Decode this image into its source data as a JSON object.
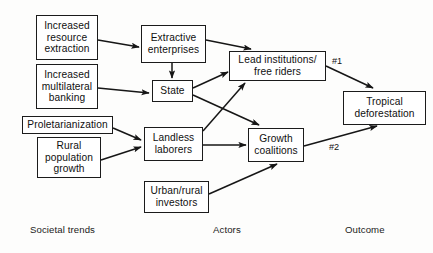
{
  "diagram": {
    "background_color": "#fdfdfc",
    "line_color": "#1b1b1b",
    "nodes": [
      {
        "id": "increased_resource_extraction",
        "label": "Increased\nresource\nextraction",
        "column": "societal-trends"
      },
      {
        "id": "increased_multilateral_banking",
        "label": "Increased\nmultilateral\nbanking",
        "column": "societal-trends"
      },
      {
        "id": "proletarianization",
        "label": "Proletarianization",
        "column": "societal-trends"
      },
      {
        "id": "rural_population_growth",
        "label": "Rural\npopulation\ngrowth",
        "column": "societal-trends"
      },
      {
        "id": "extractive_enterprises",
        "label": "Extractive\nenterprises",
        "column": "actors"
      },
      {
        "id": "state",
        "label": "State",
        "column": "actors"
      },
      {
        "id": "landless_laborers",
        "label": "Landless\nlaborers",
        "column": "actors"
      },
      {
        "id": "urban_rural_investors",
        "label": "Urban/rural\ninvestors",
        "column": "actors"
      },
      {
        "id": "lead_institutions_free_riders",
        "label": "Lead institutions/\nfree riders",
        "column": "actors"
      },
      {
        "id": "growth_coalitions",
        "label": "Growth\ncoalitions",
        "column": "actors"
      },
      {
        "id": "tropical_deforestation",
        "label": "Tropical\ndeforestation",
        "column": "outcome"
      }
    ],
    "edges": [
      {
        "from": "increased_resource_extraction",
        "to": "extractive_enterprises",
        "label": ""
      },
      {
        "from": "increased_multilateral_banking",
        "to": "state",
        "label": ""
      },
      {
        "from": "extractive_enterprises",
        "to": "state",
        "label": ""
      },
      {
        "from": "extractive_enterprises",
        "to": "lead_institutions_free_riders",
        "label": ""
      },
      {
        "from": "state",
        "to": "lead_institutions_free_riders",
        "label": ""
      },
      {
        "from": "state",
        "to": "growth_coalitions",
        "label": ""
      },
      {
        "from": "proletarianization",
        "to": "landless_laborers",
        "label": ""
      },
      {
        "from": "rural_population_growth",
        "to": "landless_laborers",
        "label": ""
      },
      {
        "from": "landless_laborers",
        "to": "lead_institutions_free_riders",
        "label": ""
      },
      {
        "from": "landless_laborers",
        "to": "growth_coalitions",
        "label": ""
      },
      {
        "from": "urban_rural_investors",
        "to": "growth_coalitions",
        "label": ""
      },
      {
        "from": "lead_institutions_free_riders",
        "to": "tropical_deforestation",
        "label": "#1"
      },
      {
        "from": "growth_coalitions",
        "to": "tropical_deforestation",
        "label": "#2"
      }
    ],
    "edge_labels": {
      "lead_to_outcome": "#1",
      "growth_to_outcome": "#2"
    },
    "column_labels": {
      "societal_trends": "Societal trends",
      "actors": "Actors",
      "outcome": "Outcome"
    },
    "node_text": {
      "increased_resource_extraction_l1": "Increased",
      "increased_resource_extraction_l2": "resource",
      "increased_resource_extraction_l3": "extraction",
      "increased_multilateral_banking_l1": "Increased",
      "increased_multilateral_banking_l2": "multilateral",
      "increased_multilateral_banking_l3": "banking",
      "proletarianization_l1": "Proletarianization",
      "rural_population_growth_l1": "Rural",
      "rural_population_growth_l2": "population",
      "rural_population_growth_l3": "growth",
      "extractive_enterprises_l1": "Extractive",
      "extractive_enterprises_l2": "enterprises",
      "state_l1": "State",
      "landless_laborers_l1": "Landless",
      "landless_laborers_l2": "laborers",
      "urban_rural_investors_l1": "Urban/rural",
      "urban_rural_investors_l2": "investors",
      "lead_institutions_l1": "Lead institutions/",
      "lead_institutions_l2": "free riders",
      "growth_coalitions_l1": "Growth",
      "growth_coalitions_l2": "coalitions",
      "tropical_deforestation_l1": "Tropical",
      "tropical_deforestation_l2": "deforestation"
    }
  }
}
